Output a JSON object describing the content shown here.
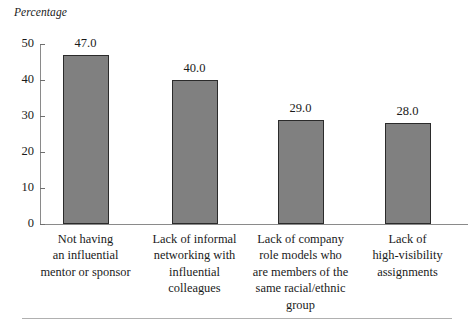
{
  "chart_data": {
    "type": "bar",
    "title": "",
    "subtitle": "",
    "xlabel": "",
    "ylabel": "Percentage",
    "ylim": [
      0,
      50
    ],
    "ytick_values": [
      0,
      10,
      20,
      30,
      40,
      50
    ],
    "ytick_labels": [
      "0",
      "10",
      "20",
      "30",
      "40",
      "50"
    ],
    "grid": false,
    "legend": false,
    "legend_position": "none",
    "bar_fill_color": "#808080",
    "bar_edge_color": "#2b2b2b",
    "categories": [
      "Not having an influential mentor or sponsor",
      "Lack of informal networking with influential colleagues",
      "Lack of company role models who are members of the same racial/ethnic group",
      "Lack of high-visibility assignments"
    ],
    "category_lines": [
      [
        "Not having",
        "an influential",
        "mentor or sponsor"
      ],
      [
        "Lack of informal",
        "networking with",
        "influential",
        "colleagues"
      ],
      [
        "Lack of company",
        "role models who",
        "are members of the",
        "same racial/ethnic",
        "group"
      ],
      [
        "Lack of",
        "high-visibility",
        "assignments"
      ]
    ],
    "values": [
      47.0,
      40.0,
      29.0,
      28.0
    ],
    "value_labels": [
      "47.0",
      "40.0",
      "29.0",
      "28.0"
    ]
  }
}
